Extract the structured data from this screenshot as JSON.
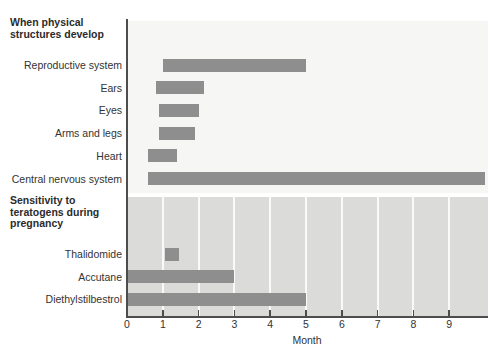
{
  "chart_data": {
    "type": "bar",
    "orientation": "horizontal",
    "title": "",
    "xlabel": "Month",
    "xticks": [
      0,
      1,
      2,
      3,
      4,
      5,
      6,
      7,
      8,
      9
    ],
    "xlim": [
      0,
      10
    ],
    "grid": "white vertical gridlines in lower shaded band",
    "bar_color": "#8e8e8e",
    "axis_color": "#4d4d4d",
    "groups": [
      {
        "title": "When physical structures develop",
        "title_lines": [
          "When physical",
          "structures develop"
        ],
        "background": "#f6f6f4",
        "rows": [
          {
            "label": "Reproductive system",
            "start": 1.0,
            "end": 5.0
          },
          {
            "label": "Ears",
            "start": 0.8,
            "end": 2.15
          },
          {
            "label": "Eyes",
            "start": 0.9,
            "end": 2.0
          },
          {
            "label": "Arms and legs",
            "start": 0.9,
            "end": 1.9
          },
          {
            "label": "Heart",
            "start": 0.6,
            "end": 1.4
          },
          {
            "label": "Central nervous system",
            "start": 0.6,
            "end": 10.0
          }
        ]
      },
      {
        "title": "Sensitivity to teratogens during pregnancy",
        "title_lines": [
          "Sensitivity to",
          "teratogens during",
          "pregnancy"
        ],
        "background": "#dbdbd9",
        "rows": [
          {
            "label": "Thalidomide",
            "start": 1.05,
            "end": 1.45
          },
          {
            "label": "Accutane",
            "start": 0.0,
            "end": 3.0
          },
          {
            "label": "Diethylstilbestrol",
            "start": 0.0,
            "end": 5.0
          }
        ]
      }
    ]
  }
}
